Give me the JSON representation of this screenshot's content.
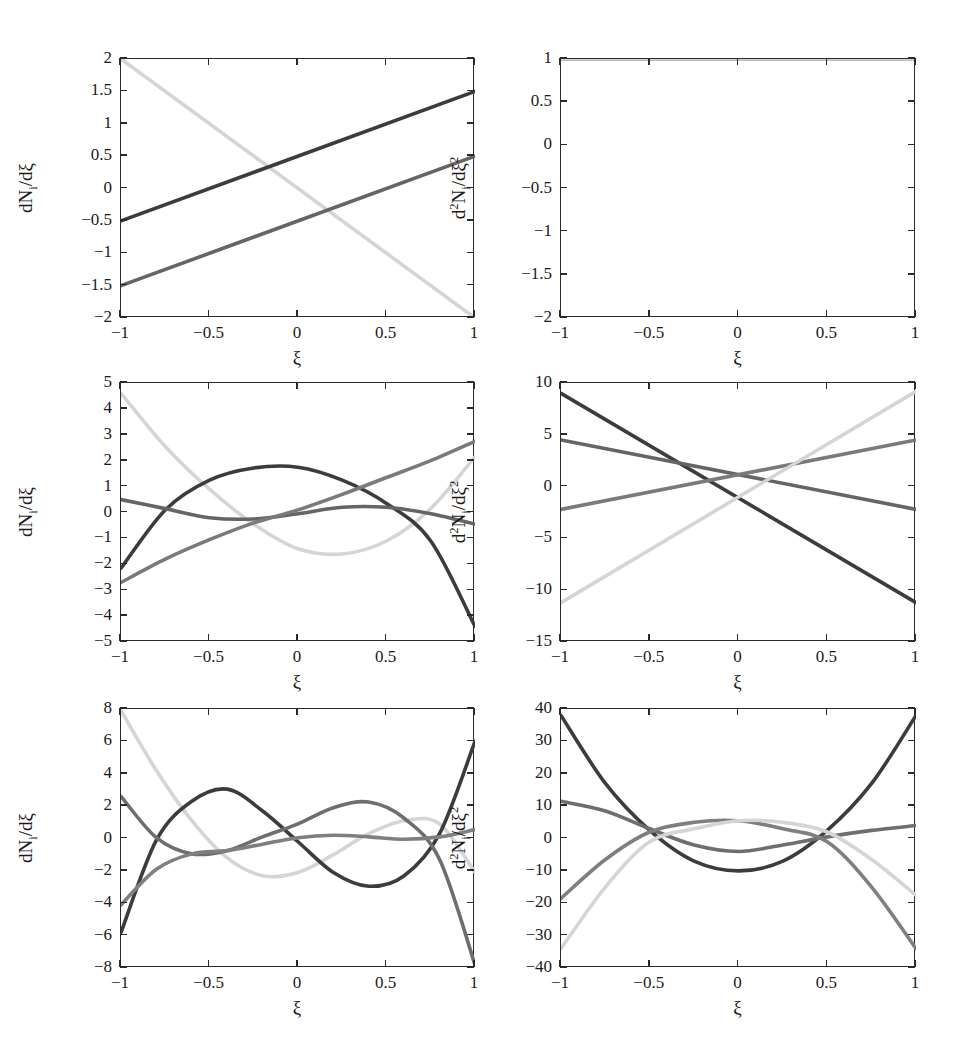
{
  "figure": {
    "background": "#ffffff",
    "axis_color": "#2a2a2a",
    "series_colors": [
      "#3c3c3c",
      "#656565",
      "#d5d5d5",
      "#8f8f8f"
    ],
    "xlabel": "ξ",
    "ylabel_first": "dNᵢ/dξ",
    "ylabel_second": "d²Nᵢ/dξ²"
  },
  "chart_data": [
    {
      "type": "line",
      "panel": "top-left",
      "title": "",
      "xlabel": "ξ",
      "ylabel": "dN_i/dξ",
      "xlim": [
        -1,
        1
      ],
      "ylim": [
        -2,
        2
      ],
      "xticks": [
        -1,
        -0.5,
        0,
        0.5,
        1
      ],
      "xticklabels": [
        "−1",
        "−0.5",
        "0",
        "0.5",
        "1"
      ],
      "yticks": [
        -2,
        -1.5,
        -1,
        -0.5,
        0,
        0.5,
        1,
        1.5,
        2
      ],
      "yticklabels": [
        "−2",
        "−1.5",
        "−1",
        "−0.5",
        "0",
        "0.5",
        "1",
        "1.5",
        "2"
      ],
      "grid": false,
      "legend": "none",
      "series": [
        {
          "name": "dN1/dξ",
          "color": "#d5d5d5",
          "x": [
            -1,
            1
          ],
          "values": [
            2,
            -2
          ]
        },
        {
          "name": "dN2/dξ",
          "color": "#3c3c3c",
          "x": [
            -1,
            1
          ],
          "values": [
            -0.5,
            1.5
          ]
        },
        {
          "name": "dN3/dξ",
          "color": "#656565",
          "x": [
            -1,
            1
          ],
          "values": [
            -1.5,
            0.5
          ]
        }
      ]
    },
    {
      "type": "line",
      "panel": "top-right",
      "title": "",
      "xlabel": "ξ",
      "ylabel": "d^2N_i/dξ^2",
      "xlim": [
        -1,
        1
      ],
      "ylim": [
        -2,
        1
      ],
      "xticks": [
        -1,
        -0.5,
        0,
        0.5,
        1
      ],
      "xticklabels": [
        "−1",
        "−0.5",
        "0",
        "0.5",
        "1"
      ],
      "yticks": [
        -2,
        -1.5,
        -1,
        -0.5,
        0,
        0.5,
        1
      ],
      "yticklabels": [
        "−2",
        "−1.5",
        "−1",
        "−0.5",
        "0",
        "0.5",
        "1"
      ],
      "grid": false,
      "legend": "none",
      "series": [
        {
          "name": "d2N1/dξ2",
          "color": "#3c3c3c",
          "x": [
            -1,
            1
          ],
          "values": [
            1,
            1
          ]
        },
        {
          "name": "d2N2/dξ2",
          "color": "#656565",
          "x": [
            -1,
            1
          ],
          "values": [
            1,
            1
          ]
        },
        {
          "name": "d2N3/dξ2",
          "color": "#d5d5d5",
          "x": [
            -1,
            1
          ],
          "values": [
            1,
            1
          ]
        }
      ]
    },
    {
      "type": "line",
      "panel": "middle-left",
      "title": "",
      "xlabel": "ξ",
      "ylabel": "dN_i/dξ",
      "xlim": [
        -1,
        1
      ],
      "ylim": [
        -5,
        5
      ],
      "xticks": [
        -1,
        -0.5,
        0,
        0.5,
        1
      ],
      "xticklabels": [
        "−1",
        "−0.5",
        "0",
        "0.5",
        "1"
      ],
      "yticks": [
        -5,
        -4,
        -3,
        -2,
        -1,
        0,
        1,
        2,
        3,
        4,
        5
      ],
      "yticklabels": [
        "−5",
        "−4",
        "−3",
        "−2",
        "−1",
        "0",
        "1",
        "2",
        "3",
        "4",
        "5"
      ],
      "grid": false,
      "legend": "none",
      "series": [
        {
          "name": "dN1/dξ",
          "color": "#d5d5d5",
          "x": [
            -1,
            -0.75,
            -0.5,
            -0.25,
            0,
            0.25,
            0.5,
            0.75,
            1
          ],
          "values": [
            4.6,
            2.55,
            0.9,
            -0.45,
            -1.4,
            -1.6,
            -1.1,
            0.15,
            2.15
          ]
        },
        {
          "name": "dN2/dξ",
          "color": "#3c3c3c",
          "x": [
            -1,
            -0.75,
            -0.5,
            -0.25,
            0,
            0.25,
            0.5,
            0.75,
            1
          ],
          "values": [
            -2.15,
            0.1,
            1.25,
            1.72,
            1.75,
            1.25,
            0.35,
            -1.1,
            -4.4
          ]
        },
        {
          "name": "dN3/dξ",
          "color": "#656565",
          "x": [
            -1,
            -0.75,
            -0.5,
            -0.25,
            0,
            0.25,
            0.5,
            0.75,
            1
          ],
          "values": [
            0.5,
            0.15,
            -0.2,
            -0.25,
            -0.05,
            0.2,
            0.2,
            -0.05,
            -0.45
          ]
        },
        {
          "name": "dN4/dξ",
          "color": "#7a7a7a",
          "x": [
            -1,
            -0.75,
            -0.5,
            -0.25,
            0,
            0.25,
            0.5,
            0.75,
            1
          ],
          "values": [
            -2.7,
            -1.8,
            -1.05,
            -0.4,
            0.1,
            0.7,
            1.35,
            2.0,
            2.75
          ]
        }
      ]
    },
    {
      "type": "line",
      "panel": "middle-right",
      "title": "",
      "xlabel": "ξ",
      "ylabel": "d^2N_i/dξ^2",
      "xlim": [
        -1,
        1
      ],
      "ylim": [
        -15,
        10
      ],
      "xticks": [
        -1,
        -0.5,
        0,
        0.5,
        1
      ],
      "xticklabels": [
        "−1",
        "−0.5",
        "0",
        "0.5",
        "1"
      ],
      "yticks": [
        -15,
        -10,
        -5,
        0,
        5,
        10
      ],
      "yticklabels": [
        "−15",
        "−10",
        "−5",
        "0",
        "5",
        "10"
      ],
      "grid": false,
      "legend": "none",
      "series": [
        {
          "name": "d2N1/dξ2",
          "color": "#3c3c3c",
          "x": [
            -1,
            1
          ],
          "values": [
            9.0,
            -11.2
          ]
        },
        {
          "name": "d2N2/dξ2",
          "color": "#656565",
          "x": [
            -1,
            1
          ],
          "values": [
            4.5,
            -2.2
          ]
        },
        {
          "name": "d2N3/dξ2",
          "color": "#7a7a7a",
          "x": [
            -1,
            1
          ],
          "values": [
            -2.2,
            4.5
          ]
        },
        {
          "name": "d2N4/dξ2",
          "color": "#d5d5d5",
          "x": [
            -1,
            1
          ],
          "values": [
            -11.2,
            9.2
          ]
        }
      ]
    },
    {
      "type": "line",
      "panel": "bottom-left",
      "title": "",
      "xlabel": "ξ",
      "ylabel": "dN_i/dξ",
      "xlim": [
        -1,
        1
      ],
      "ylim": [
        -8,
        8
      ],
      "xticks": [
        -1,
        -0.5,
        0,
        0.5,
        1
      ],
      "xticklabels": [
        "−1",
        "−0.5",
        "0",
        "0.5",
        "1"
      ],
      "yticks": [
        -8,
        -6,
        -4,
        -2,
        0,
        2,
        4,
        6,
        8
      ],
      "yticklabels": [
        "−8",
        "−6",
        "−4",
        "−2",
        "0",
        "2",
        "4",
        "6",
        "8"
      ],
      "grid": false,
      "legend": "none",
      "series": [
        {
          "name": "dN1/dξ",
          "color": "#d5d5d5",
          "x": [
            -1,
            -0.8,
            -0.6,
            -0.4,
            -0.2,
            0,
            0.2,
            0.4,
            0.6,
            0.8,
            1
          ],
          "values": [
            7.9,
            4.2,
            1.1,
            -1.2,
            -2.3,
            -2.1,
            -1.0,
            0.3,
            1.1,
            0.9,
            -2.1
          ]
        },
        {
          "name": "dN2/dξ",
          "color": "#3c3c3c",
          "x": [
            -1,
            -0.8,
            -0.6,
            -0.4,
            -0.2,
            0,
            0.2,
            0.4,
            0.6,
            0.8,
            1
          ],
          "values": [
            -5.8,
            -0.1,
            2.3,
            3.05,
            1.7,
            -0.2,
            -2.1,
            -2.95,
            -2.3,
            0.3,
            6.0
          ]
        },
        {
          "name": "dN3/dξ",
          "color": "#6e6e6e",
          "x": [
            -1,
            -0.8,
            -0.6,
            -0.4,
            -0.2,
            0,
            0.2,
            0.4,
            0.6,
            0.8,
            1
          ],
          "values": [
            2.6,
            0.05,
            -0.95,
            -0.75,
            0.1,
            0.9,
            1.9,
            2.25,
            1.25,
            -1.3,
            -7.8
          ]
        },
        {
          "name": "dN4/dξ",
          "color": "#7f7f7f",
          "x": [
            -1,
            -0.8,
            -0.6,
            -0.4,
            -0.2,
            0,
            0.2,
            0.4,
            0.6,
            0.8,
            1
          ],
          "values": [
            -4.1,
            -1.9,
            -0.95,
            -0.75,
            -0.35,
            0.05,
            0.2,
            0.1,
            -0.05,
            0.1,
            0.55
          ]
        }
      ]
    },
    {
      "type": "line",
      "panel": "bottom-right",
      "title": "",
      "xlabel": "ξ",
      "ylabel": "d^2N_i/dξ^2",
      "xlim": [
        -1,
        1
      ],
      "ylim": [
        -40,
        40
      ],
      "xticks": [
        -1,
        -0.5,
        0,
        0.5,
        1
      ],
      "xticklabels": [
        "−1",
        "−0.5",
        "0",
        "0.5",
        "1"
      ],
      "yticks": [
        -40,
        -30,
        -20,
        -10,
        0,
        10,
        20,
        30,
        40
      ],
      "yticklabels": [
        "−40",
        "−30",
        "−20",
        "−10",
        "0",
        "10",
        "20",
        "30",
        "40"
      ],
      "grid": false,
      "legend": "none",
      "series": [
        {
          "name": "d2N1/dξ2",
          "color": "#3c3c3c",
          "x": [
            -1,
            -0.75,
            -0.5,
            -0.25,
            0,
            0.25,
            0.5,
            0.75,
            1
          ],
          "values": [
            38,
            17,
            2.5,
            -7.0,
            -10.0,
            -7.0,
            2.5,
            17,
            38
          ]
        },
        {
          "name": "d2N2/dξ2",
          "color": "#6e6e6e",
          "x": [
            -1,
            -0.75,
            -0.5,
            -0.25,
            0,
            0.25,
            0.5,
            0.75,
            1
          ],
          "values": [
            11.5,
            8.5,
            3.0,
            -2.0,
            -4.0,
            -2.0,
            0.5,
            2.5,
            4.0
          ]
        },
        {
          "name": "d2N3/dξ2",
          "color": "#7f7f7f",
          "x": [
            -1,
            -0.75,
            -0.5,
            -0.25,
            0,
            0.25,
            0.5,
            0.75,
            1
          ],
          "values": [
            -18.5,
            -6.5,
            2.0,
            5.0,
            5.5,
            3.0,
            -1.0,
            -15.0,
            -34.0
          ]
        },
        {
          "name": "d2N4/dξ2",
          "color": "#d5d5d5",
          "x": [
            -1,
            -0.75,
            -0.5,
            -0.25,
            0,
            0.25,
            0.5,
            0.75,
            1
          ],
          "values": [
            -34.0,
            -15.0,
            -1.0,
            3.0,
            5.5,
            5.0,
            2.0,
            -6.5,
            -17.5
          ]
        }
      ]
    }
  ]
}
